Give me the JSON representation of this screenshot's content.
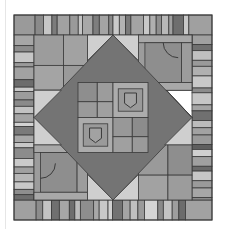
{
  "image": {
    "title": "Quilt pattern",
    "description": "Gray-scale patchwork quilt: striped border surrounding a square-in-square (diamond) block with pocket motifs"
  },
  "palette": {
    "outline": "#3a3a3a",
    "light": "#c8c8c8",
    "lighter": "#d6d6d6",
    "mid": "#a0a0a0",
    "midlight": "#b2b2b2",
    "middark": "#8c8c8c",
    "dark": "#7a7a7a",
    "darker": "#686868"
  },
  "quilt": {
    "x": 14,
    "y": 15,
    "w": 198,
    "h": 205,
    "border": 20,
    "top_strip": [
      {
        "w": 20,
        "c": "#9a9a9a"
      },
      {
        "w": 8,
        "c": "#8a8a8a"
      },
      {
        "w": 8,
        "c": "#c6c6c6"
      },
      {
        "w": 5,
        "c": "#7c7c7c"
      },
      {
        "w": 12,
        "c": "#a2a2a2"
      },
      {
        "w": 8,
        "c": "#9a9a9a"
      },
      {
        "w": 4,
        "c": "#c4c4c4"
      },
      {
        "w": 10,
        "c": "#a8a8a8"
      },
      {
        "w": 6,
        "c": "#7e7e7e"
      },
      {
        "w": 9,
        "c": "#a4a4a4"
      },
      {
        "w": 4,
        "c": "#8a8a8a"
      },
      {
        "w": 6,
        "c": "#cacaca"
      },
      {
        "w": 6,
        "c": "#b4b4b4"
      },
      {
        "w": 5,
        "c": "#7a7a7a"
      },
      {
        "w": 12,
        "c": "#a4a4a4"
      },
      {
        "w": 6,
        "c": "#c8c8c8"
      },
      {
        "w": 6,
        "c": "#b0b0b0"
      },
      {
        "w": 5,
        "c": "#8e8e8e"
      },
      {
        "w": 7,
        "c": "#b8b8b8"
      },
      {
        "w": 4,
        "c": "#a0a0a0"
      },
      {
        "w": 10,
        "c": "#6e6e6e"
      },
      {
        "w": 5,
        "c": "#c8c8c8"
      },
      {
        "w": 22,
        "c": "#a0a0a0"
      }
    ],
    "bottom_strip": [
      {
        "w": 20,
        "c": "#a0a0a0"
      },
      {
        "w": 6,
        "c": "#8c8c8c"
      },
      {
        "w": 8,
        "c": "#c4c4c4"
      },
      {
        "w": 7,
        "c": "#707070"
      },
      {
        "w": 9,
        "c": "#a6a6a6"
      },
      {
        "w": 5,
        "c": "#6e6e6e"
      },
      {
        "w": 5,
        "c": "#bcbcbc"
      },
      {
        "w": 12,
        "c": "#8e8e8e"
      },
      {
        "w": 5,
        "c": "#a8a8a8"
      },
      {
        "w": 8,
        "c": "#c8c8c8"
      },
      {
        "w": 4,
        "c": "#d0d0d0"
      },
      {
        "w": 9,
        "c": "#727272"
      },
      {
        "w": 7,
        "c": "#a4a4a4"
      },
      {
        "w": 7,
        "c": "#c0c0c0"
      },
      {
        "w": 6,
        "c": "#9a9a9a"
      },
      {
        "w": 12,
        "c": "#d4d4d4"
      },
      {
        "w": 5,
        "c": "#8a8a8a"
      },
      {
        "w": 8,
        "c": "#c4c4c4"
      },
      {
        "w": 6,
        "c": "#9e9e9e"
      },
      {
        "w": 6,
        "c": "#6c6c6c"
      },
      {
        "w": 24,
        "c": "#a2a2a2"
      }
    ],
    "left_strip": [
      {
        "h": 10,
        "c": "#a6a6a6"
      },
      {
        "h": 6,
        "c": "#8c8c8c"
      },
      {
        "h": 10,
        "c": "#c6c6c6"
      },
      {
        "h": 4,
        "c": "#9a9a9a"
      },
      {
        "h": 12,
        "c": "#a2a2a2"
      },
      {
        "h": 7,
        "c": "#6c6c6c"
      },
      {
        "h": 4,
        "c": "#c8c8c8"
      },
      {
        "h": 8,
        "c": "#9c9c9c"
      },
      {
        "h": 6,
        "c": "#8a8a8a"
      },
      {
        "h": 7,
        "c": "#c2c2c2"
      },
      {
        "h": 8,
        "c": "#a4a4a4"
      },
      {
        "h": 4,
        "c": "#d2d2d2"
      },
      {
        "h": 8,
        "c": "#7a7a7a"
      },
      {
        "h": 7,
        "c": "#a8a8a8"
      },
      {
        "h": 5,
        "c": "#c8c8c8"
      },
      {
        "h": 10,
        "c": "#8c8c8c"
      },
      {
        "h": 8,
        "c": "#cacaca"
      },
      {
        "h": 6,
        "c": "#a0a0a0"
      },
      {
        "h": 8,
        "c": "#b6b6b6"
      },
      {
        "h": 7,
        "c": "#c8c8c8"
      },
      {
        "h": 5,
        "c": "#8e8e8e"
      },
      {
        "h": 5,
        "c": "#6e6e6e"
      }
    ],
    "right_strip": [
      {
        "h": 8,
        "c": "#a0a0a0"
      },
      {
        "h": 5,
        "c": "#707070"
      },
      {
        "h": 8,
        "c": "#c0c0c0"
      },
      {
        "h": 5,
        "c": "#9a9a9a"
      },
      {
        "h": 8,
        "c": "#b0b0b0"
      },
      {
        "h": 10,
        "c": "#c8c8c8"
      },
      {
        "h": 4,
        "c": "#8c8c8c"
      },
      {
        "h": 10,
        "c": "#c6c6c6"
      },
      {
        "h": 5,
        "c": "#a4a4a4"
      },
      {
        "h": 8,
        "c": "#707070"
      },
      {
        "h": 6,
        "c": "#bcbcbc"
      },
      {
        "h": 6,
        "c": "#a2a2a2"
      },
      {
        "h": 8,
        "c": "#9a9a9a"
      },
      {
        "h": 4,
        "c": "#5e5e5e"
      },
      {
        "h": 6,
        "c": "#d0d0d0"
      },
      {
        "h": 8,
        "c": "#a0a0a0"
      },
      {
        "h": 4,
        "c": "#6a6a6a"
      },
      {
        "h": 8,
        "c": "#c6c6c6"
      },
      {
        "h": 6,
        "c": "#9a9a9a"
      },
      {
        "h": 8,
        "c": "#a6a6a6"
      },
      {
        "h": 2,
        "c": "#8a8a8a"
      }
    ],
    "diamond": {
      "dark": "#747474",
      "light": "#cfcfcf"
    },
    "corner_blocks": {
      "tl": {
        "cells": [
          "#9c9c9c",
          "#a2a2a2",
          "#a4a4a4",
          "#9a9a9a"
        ]
      },
      "tr": {
        "frame": "#9c9c9c",
        "inner": "#8e8e8e",
        "accent": "#a8a8a8",
        "motif": "quarter-circle"
      },
      "bl": {
        "frame": "#9c9c9c",
        "inner": "#8e8e8e",
        "accent": "#a8a8a8",
        "motif": "quarter-circle"
      },
      "br": {
        "cells": [
          "#9a9a9a",
          "#8e8e8e",
          "#a2a2a2",
          "#9c9c9c"
        ]
      }
    },
    "center_quadrants": {
      "tl": {
        "cells": [
          "#8e8e8e",
          "#9c9c9c",
          "#9a9a9a",
          "#a0a0a0"
        ]
      },
      "tr": {
        "frame": "#acacac",
        "inner": "#9a9a9a",
        "pocket": "#a2a2a2",
        "motif": "pocket"
      },
      "bl": {
        "frame": "#acacac",
        "inner": "#9a9a9a",
        "pocket": "#a2a2a2",
        "motif": "pocket"
      },
      "br": {
        "cells": [
          "#989898",
          "#8c8c8c",
          "#a0a0a0",
          "#9a9a9a"
        ]
      }
    }
  }
}
